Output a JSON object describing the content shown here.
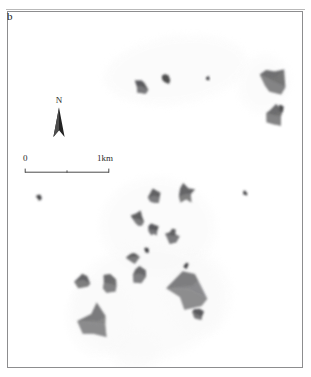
{
  "figure": {
    "panel_label": "b",
    "background_color": "#ffffff",
    "frame_color": "#8d8d8f"
  },
  "north_arrow": {
    "label": "N",
    "icon": "north-arrow-icon",
    "color": "#2a2a2a"
  },
  "scale_bar": {
    "left_label": "0",
    "right_label": "1km",
    "tick_count": 3,
    "color": "#4a4a4a"
  },
  "map": {
    "land_color": "#3a3a3c",
    "land_shade_light": "#8e8e90",
    "land_shade_mid": "#646466",
    "halo_color": "#efefef",
    "halo_color_faint": "#f6f6f6",
    "description": "Grayscale archipelago map: dark angular island polygons with internal relief shading, surrounded by faint stippled shallow-water halos."
  },
  "chart_data": {
    "type": "map",
    "title": "b",
    "xlabel": "",
    "ylabel": "",
    "legend": [],
    "scale": {
      "from": "0",
      "to": "1km"
    },
    "orientation": "N",
    "halos": [
      {
        "name": "north-reef-halo",
        "cx": 168,
        "cy": 58,
        "rx": 72,
        "ry": 34,
        "rot": -8,
        "opacity": 0.55
      },
      {
        "name": "northeast-reef-halo",
        "cx": 256,
        "cy": 72,
        "rx": 26,
        "ry": 30,
        "rot": 12,
        "opacity": 0.5
      },
      {
        "name": "central-reef-halo",
        "cx": 150,
        "cy": 215,
        "rx": 58,
        "ry": 50,
        "rot": 6,
        "opacity": 0.5
      },
      {
        "name": "south-reef-halo",
        "cx": 140,
        "cy": 290,
        "rx": 76,
        "ry": 58,
        "rot": -4,
        "opacity": 0.5
      },
      {
        "name": "southwest-reef-halo",
        "cx": 92,
        "cy": 305,
        "rx": 34,
        "ry": 40,
        "rot": 0,
        "opacity": 0.45
      },
      {
        "name": "southeast-reef-halo",
        "cx": 190,
        "cy": 282,
        "rx": 34,
        "ry": 42,
        "rot": -10,
        "opacity": 0.45
      },
      {
        "name": "lower-tail-halo",
        "cx": 128,
        "cy": 340,
        "rx": 26,
        "ry": 24,
        "rot": 0,
        "opacity": 0.4
      }
    ],
    "islands": [
      {
        "name": "island-n-01",
        "cx": 133,
        "cy": 74,
        "size": 7.5,
        "shade": 0.85
      },
      {
        "name": "island-n-02",
        "cx": 158,
        "cy": 67,
        "size": 5.0,
        "shade": 0.9
      },
      {
        "name": "island-n-03",
        "cx": 200,
        "cy": 66,
        "size": 2.2,
        "shade": 1.0
      },
      {
        "name": "island-ne-big",
        "cx": 264,
        "cy": 69,
        "size": 14.0,
        "shade": 0.7
      },
      {
        "name": "island-ne-small",
        "cx": 273,
        "cy": 96,
        "size": 3.0,
        "shade": 0.9
      },
      {
        "name": "island-ne-lower",
        "cx": 267,
        "cy": 104,
        "size": 10.0,
        "shade": 0.72
      },
      {
        "name": "island-w-speck",
        "cx": 31,
        "cy": 185,
        "size": 3.0,
        "shade": 0.95
      },
      {
        "name": "island-c-01",
        "cx": 146,
        "cy": 184,
        "size": 7.5,
        "shade": 0.8
      },
      {
        "name": "island-c-02",
        "cx": 178,
        "cy": 182,
        "size": 9.0,
        "shade": 0.78
      },
      {
        "name": "island-c-03",
        "cx": 130,
        "cy": 207,
        "size": 7.0,
        "shade": 0.82
      },
      {
        "name": "island-c-04",
        "cx": 145,
        "cy": 218,
        "size": 6.0,
        "shade": 0.85
      },
      {
        "name": "island-c-05",
        "cx": 164,
        "cy": 224,
        "size": 7.0,
        "shade": 0.8
      },
      {
        "name": "island-c-06",
        "cx": 237,
        "cy": 181,
        "size": 3.0,
        "shade": 0.95
      },
      {
        "name": "island-c-07",
        "cx": 139,
        "cy": 238,
        "size": 3.0,
        "shade": 0.95
      },
      {
        "name": "island-c-08",
        "cx": 125,
        "cy": 245,
        "size": 6.5,
        "shade": 0.82
      },
      {
        "name": "island-c-09",
        "cx": 131,
        "cy": 262,
        "size": 9.0,
        "shade": 0.75
      },
      {
        "name": "island-c-10",
        "cx": 178,
        "cy": 254,
        "size": 3.0,
        "shade": 0.95
      },
      {
        "name": "island-w-01",
        "cx": 75,
        "cy": 268,
        "size": 8.0,
        "shade": 0.78
      },
      {
        "name": "island-w-02",
        "cx": 101,
        "cy": 272,
        "size": 10.0,
        "shade": 0.72
      },
      {
        "name": "island-sw-big",
        "cx": 88,
        "cy": 312,
        "size": 17.0,
        "shade": 0.6
      },
      {
        "name": "island-se-big",
        "cx": 181,
        "cy": 278,
        "size": 21.0,
        "shade": 0.58
      },
      {
        "name": "island-se-tail",
        "cx": 190,
        "cy": 303,
        "size": 6.0,
        "shade": 0.85
      }
    ]
  }
}
